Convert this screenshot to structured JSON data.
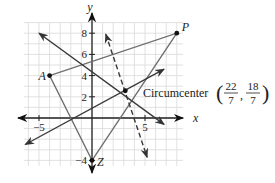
{
  "figure": {
    "axes": {
      "x_label": "x",
      "y_label": "y",
      "x_ticks": [
        {
          "value": -5,
          "label": "−5"
        },
        {
          "value": 5,
          "label": "5"
        }
      ],
      "y_ticks": [
        {
          "value": 8,
          "label": "8"
        },
        {
          "value": 6,
          "label": "6"
        },
        {
          "value": 4,
          "label": "4"
        },
        {
          "value": 2,
          "label": "2"
        },
        {
          "value": -4,
          "label": "−4"
        }
      ],
      "grid": true
    },
    "points": [
      {
        "name": "A",
        "x": -4,
        "y": 4
      },
      {
        "name": "P",
        "x": 8,
        "y": 8
      },
      {
        "name": "Z",
        "x": 0,
        "y": -4
      }
    ],
    "circumcenter": {
      "label": "Circumcenter",
      "x_num": "22",
      "x_den": "7",
      "y_num": "18",
      "y_den": "7",
      "x": 3.142857,
      "y": 2.571429
    },
    "triangle": [
      "A",
      "P",
      "Z"
    ],
    "bisectors": [
      {
        "style": "solid",
        "from": [
          -5,
          8
        ],
        "to": [
          6.8,
          -0.6
        ]
      },
      {
        "style": "solid",
        "from": [
          -6.3,
          -2.5
        ],
        "to": [
          6.8,
          4.6
        ]
      },
      {
        "style": "dashed",
        "from": [
          1.3,
          7.9
        ],
        "to": [
          5.2,
          -3.7
        ]
      }
    ],
    "colors": {
      "grid": "#d9d9d9",
      "axis": "#222222",
      "triangle": "#6e6e6e",
      "bisector": "#3a3a3a",
      "point": "#111111"
    }
  }
}
